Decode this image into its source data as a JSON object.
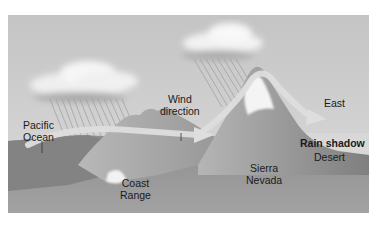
{
  "diagram": {
    "topic": "Rain shadow formation",
    "labels": {
      "pacific_ocean_line1": "Pacific",
      "pacific_ocean_line2": "Ocean",
      "wind_direction_line1": "Wind",
      "wind_direction_line2": "direction",
      "coast_range_line1": "Coast",
      "coast_range_line2": "Range",
      "sierra_nevada_line1": "Sierra",
      "sierra_nevada_line2": "Nevada",
      "east": "East",
      "rain_shadow": "Rain shadow",
      "desert": "Desert"
    },
    "colors": {
      "sky": "#c9c9c9",
      "cloud": "#f2f2f2",
      "ocean": "#7a7a7a",
      "ground": "#8c8c8c",
      "mountain": "#a8a8a8",
      "snow": "#f5f5f5",
      "wind_arrow": "#dcdcdc",
      "rain": "#9a9a9a"
    }
  }
}
